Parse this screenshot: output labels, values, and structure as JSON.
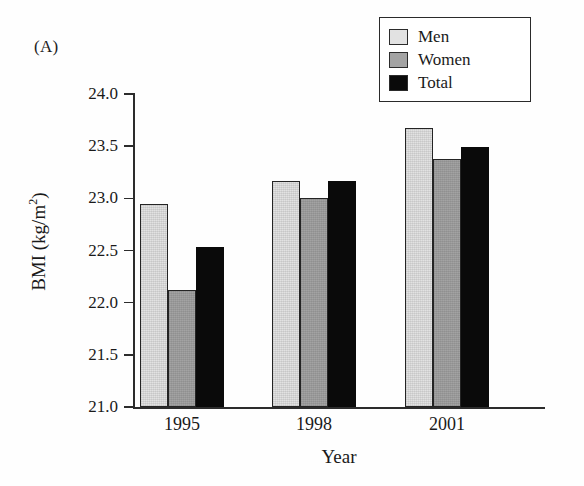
{
  "panel": {
    "label": "(A)"
  },
  "legend": {
    "position": "top-right",
    "items": [
      {
        "name": "Men",
        "color": "#e2e2e2"
      },
      {
        "name": "Women",
        "color": "#a3a3a3"
      },
      {
        "name": "Total",
        "color": "#0a0a0a"
      }
    ]
  },
  "axes": {
    "y_title_main": "BMI (kg/m",
    "y_title_sup": "2",
    "y_title_close": ")",
    "x_title": "Year",
    "y_ticks": [
      "24.0",
      "23.5",
      "23.0",
      "22.5",
      "22.0",
      "21.5",
      "21.0"
    ]
  },
  "chart_data": {
    "type": "bar",
    "title": "",
    "subtitle": "",
    "xlabel": "Year",
    "ylabel": "BMI (kg/m2)",
    "categories": [
      "1995",
      "1998",
      "2001"
    ],
    "series": [
      {
        "name": "Men",
        "color": "#e2e2e2",
        "values": [
          22.95,
          23.17,
          23.67
        ]
      },
      {
        "name": "Women",
        "color": "#a3a3a3",
        "values": [
          22.12,
          23.0,
          23.38
        ]
      },
      {
        "name": "Total",
        "color": "#0a0a0a",
        "values": [
          22.53,
          23.17,
          23.49
        ]
      }
    ],
    "ylim": [
      21.0,
      24.0
    ],
    "ytick_step": 0.5,
    "grid": false,
    "legend_position": "top-right",
    "panel_label": "(A)"
  }
}
